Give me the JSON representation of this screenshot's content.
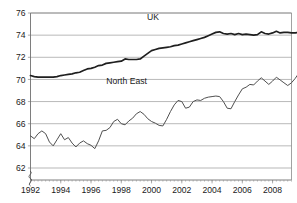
{
  "chart_data": {
    "type": "line",
    "title": "",
    "subtitle": "",
    "xlabel": "",
    "ylabel": "",
    "xlim": [
      1992.0,
      2009.25
    ],
    "ylim": [
      61.0,
      76.0
    ],
    "y_axis_break": true,
    "y_break_symbol": "axis-break",
    "grid": true,
    "grid_axis": "y",
    "legend_position": "inline-annotation",
    "yticks": [
      62,
      64,
      66,
      68,
      70,
      72,
      74,
      76
    ],
    "ytick_labels": [
      "62",
      "64",
      "66",
      "68",
      "70",
      "72",
      "74",
      "76"
    ],
    "xticks": [
      1992,
      1994,
      1996,
      1998,
      2000,
      2002,
      2004,
      2006,
      2008
    ],
    "xtick_labels": [
      "1992",
      "1994",
      "1996",
      "1998",
      "2000",
      "2002",
      "2004",
      "2006",
      "2008"
    ],
    "x_minor_tick_interval": 0.25,
    "x_start": 1992.0,
    "x_step": 0.25,
    "series": [
      {
        "name": "UK",
        "color": "#1f1f1f",
        "width": 1.7,
        "label_x": 2000.1,
        "label_y": 75.35,
        "values": [
          70.35,
          70.25,
          70.2,
          70.2,
          70.2,
          70.2,
          70.2,
          70.25,
          70.35,
          70.4,
          70.45,
          70.5,
          70.6,
          70.65,
          70.8,
          70.95,
          71.0,
          71.1,
          71.25,
          71.3,
          71.45,
          71.5,
          71.55,
          71.6,
          71.65,
          71.85,
          71.8,
          71.8,
          71.8,
          71.85,
          72.1,
          72.35,
          72.6,
          72.7,
          72.8,
          72.85,
          72.9,
          72.95,
          73.05,
          73.1,
          73.2,
          73.3,
          73.4,
          73.5,
          73.6,
          73.7,
          73.8,
          73.95,
          74.1,
          74.25,
          74.3,
          74.15,
          74.1,
          74.15,
          74.05,
          74.15,
          74.05,
          74.1,
          74.05,
          74.0,
          74.05,
          74.3,
          74.15,
          74.1,
          74.2,
          74.35,
          74.2,
          74.25,
          74.25,
          74.2,
          74.2,
          74.25,
          74.3,
          74.25,
          74.3,
          74.35,
          74.3,
          74.35,
          74.4,
          74.3,
          74.05,
          74.15,
          74.25,
          74.05,
          74.0,
          74.05,
          74.1,
          74.0,
          74.15,
          74.2,
          74.3,
          74.4,
          74.45,
          74.45,
          74.4,
          74.35,
          74.2,
          74.0,
          73.6,
          73.1,
          72.65,
          72.35,
          72.25,
          72.25,
          72.25
        ]
      },
      {
        "name": "North East",
        "color": "#4f4f4f",
        "width": 1.0,
        "label_x": 1998.35,
        "label_y": 69.6,
        "values": [
          64.9,
          64.65,
          65.1,
          65.35,
          65.1,
          64.35,
          64.0,
          64.55,
          65.1,
          64.55,
          64.75,
          64.25,
          63.9,
          64.25,
          64.45,
          64.2,
          64.05,
          63.75,
          64.45,
          65.35,
          65.4,
          65.65,
          66.2,
          66.4,
          66.0,
          65.9,
          66.25,
          66.5,
          66.9,
          67.1,
          66.85,
          66.45,
          66.2,
          66.05,
          65.85,
          65.8,
          66.4,
          67.1,
          67.7,
          68.1,
          68.0,
          67.4,
          67.5,
          68.0,
          68.15,
          68.1,
          68.3,
          68.4,
          68.45,
          68.5,
          68.45,
          68.0,
          67.4,
          67.35,
          68.0,
          68.6,
          69.15,
          69.3,
          69.55,
          69.5,
          69.85,
          70.15,
          69.85,
          69.55,
          69.85,
          70.2,
          69.95,
          69.7,
          69.45,
          69.7,
          70.1,
          70.6,
          71.05,
          71.2,
          70.75,
          70.3,
          70.1,
          70.6,
          71.15,
          71.35,
          71.1,
          70.6,
          70.2,
          70.15,
          70.35,
          70.3,
          70.15,
          70.2,
          70.1,
          69.85,
          69.6,
          69.0,
          68.4,
          67.85,
          67.7,
          68.15,
          68.75,
          69.0,
          68.8,
          68.5,
          68.3,
          68.25,
          68.6,
          68.95,
          69.05
        ]
      }
    ]
  },
  "axis": {
    "break_marker_name": "y-axis-break-marker"
  }
}
